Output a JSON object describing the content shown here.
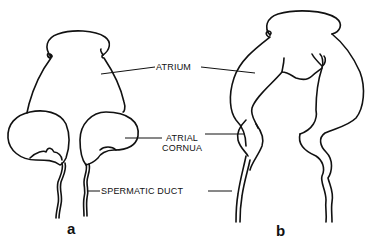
{
  "figure": {
    "background": "#ffffff",
    "ink_color": "#111111",
    "labels": {
      "atrium": "ATRIUM",
      "atrial_cornua_line1": "ATRIAL",
      "atrial_cornua_line2": "CORNUA",
      "spermatic_duct": "SPERMATIC DUCT"
    },
    "panels": {
      "a": "a",
      "b": "b"
    }
  }
}
